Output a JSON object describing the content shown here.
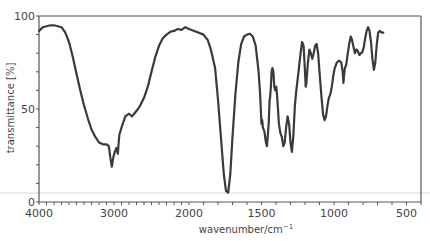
{
  "chart_data": {
    "type": "line",
    "title": "",
    "xlabel": "wavenumber/cm",
    "xlabel_superscript": "−1",
    "ylabel": "transmittance [%]",
    "xlim": [
      4000,
      400
    ],
    "ylim": [
      0,
      100
    ],
    "x_reversed": true,
    "x_scale_break": 2000,
    "grid": false,
    "legend": null,
    "x_ticks": [
      4000,
      3000,
      2000,
      1500,
      1000,
      500
    ],
    "y_ticks": [
      0,
      50,
      100
    ],
    "line_color": "#3a3a3a",
    "series": [
      {
        "name": "IR spectrum",
        "points": [
          [
            4000,
            92
          ],
          [
            3950,
            94
          ],
          [
            3900,
            94.5
          ],
          [
            3850,
            95
          ],
          [
            3800,
            95
          ],
          [
            3750,
            94.5
          ],
          [
            3700,
            94
          ],
          [
            3650,
            91
          ],
          [
            3600,
            86
          ],
          [
            3550,
            78
          ],
          [
            3500,
            69
          ],
          [
            3450,
            60
          ],
          [
            3400,
            52
          ],
          [
            3350,
            45
          ],
          [
            3300,
            39
          ],
          [
            3250,
            35
          ],
          [
            3200,
            32
          ],
          [
            3150,
            31
          ],
          [
            3100,
            31
          ],
          [
            3070,
            30
          ],
          [
            3050,
            24
          ],
          [
            3030,
            19
          ],
          [
            3010,
            24
          ],
          [
            2990,
            27
          ],
          [
            2970,
            29
          ],
          [
            2950,
            26
          ],
          [
            2930,
            36
          ],
          [
            2900,
            40
          ],
          [
            2850,
            46
          ],
          [
            2800,
            47.5
          ],
          [
            2760,
            46
          ],
          [
            2720,
            48
          ],
          [
            2680,
            50
          ],
          [
            2650,
            52
          ],
          [
            2600,
            56
          ],
          [
            2550,
            62
          ],
          [
            2500,
            70
          ],
          [
            2450,
            78
          ],
          [
            2400,
            84
          ],
          [
            2350,
            88
          ],
          [
            2300,
            90
          ],
          [
            2250,
            91.5
          ],
          [
            2200,
            92
          ],
          [
            2150,
            93
          ],
          [
            2100,
            92.5
          ],
          [
            2050,
            94
          ],
          [
            2000,
            93
          ],
          [
            1950,
            91.5
          ],
          [
            1900,
            90
          ],
          [
            1870,
            87
          ],
          [
            1850,
            82
          ],
          [
            1820,
            72
          ],
          [
            1800,
            55
          ],
          [
            1780,
            35
          ],
          [
            1760,
            15
          ],
          [
            1745,
            6
          ],
          [
            1730,
            5
          ],
          [
            1715,
            15
          ],
          [
            1700,
            35
          ],
          [
            1680,
            58
          ],
          [
            1660,
            75
          ],
          [
            1640,
            85
          ],
          [
            1620,
            89
          ],
          [
            1600,
            90
          ],
          [
            1580,
            90.5
          ],
          [
            1560,
            89
          ],
          [
            1540,
            84
          ],
          [
            1520,
            70
          ],
          [
            1510,
            58
          ],
          [
            1500,
            42
          ],
          [
            1495,
            44
          ],
          [
            1490,
            40
          ],
          [
            1480,
            38
          ],
          [
            1470,
            32
          ],
          [
            1462,
            30
          ],
          [
            1455,
            37
          ],
          [
            1450,
            43
          ],
          [
            1445,
            54
          ],
          [
            1440,
            57
          ],
          [
            1435,
            62
          ],
          [
            1430,
            70
          ],
          [
            1425,
            72
          ],
          [
            1418,
            70
          ],
          [
            1412,
            62
          ],
          [
            1405,
            60
          ],
          [
            1398,
            62
          ],
          [
            1390,
            55
          ],
          [
            1380,
            42
          ],
          [
            1370,
            37
          ],
          [
            1360,
            35
          ],
          [
            1350,
            30
          ],
          [
            1340,
            32
          ],
          [
            1330,
            40
          ],
          [
            1320,
            46
          ],
          [
            1310,
            42
          ],
          [
            1300,
            32
          ],
          [
            1290,
            27
          ],
          [
            1280,
            36
          ],
          [
            1270,
            52
          ],
          [
            1260,
            60
          ],
          [
            1245,
            70
          ],
          [
            1230,
            80
          ],
          [
            1220,
            86
          ],
          [
            1210,
            84
          ],
          [
            1200,
            70
          ],
          [
            1195,
            62
          ],
          [
            1190,
            64
          ],
          [
            1180,
            75
          ],
          [
            1170,
            82
          ],
          [
            1160,
            80
          ],
          [
            1150,
            77
          ],
          [
            1140,
            80
          ],
          [
            1130,
            84
          ],
          [
            1120,
            85
          ],
          [
            1110,
            80
          ],
          [
            1100,
            70
          ],
          [
            1085,
            55
          ],
          [
            1075,
            47
          ],
          [
            1065,
            44
          ],
          [
            1055,
            46
          ],
          [
            1045,
            52
          ],
          [
            1035,
            56
          ],
          [
            1025,
            58
          ],
          [
            1015,
            62
          ],
          [
            1005,
            68
          ],
          [
            995,
            72
          ],
          [
            980,
            75
          ],
          [
            965,
            76
          ],
          [
            950,
            75
          ],
          [
            940,
            70
          ],
          [
            935,
            64
          ],
          [
            930,
            68
          ],
          [
            925,
            72
          ],
          [
            915,
            74
          ],
          [
            905,
            80
          ],
          [
            895,
            85
          ],
          [
            885,
            89
          ],
          [
            875,
            87
          ],
          [
            865,
            83
          ],
          [
            855,
            80
          ],
          [
            845,
            82
          ],
          [
            835,
            81
          ],
          [
            825,
            79
          ],
          [
            815,
            80
          ],
          [
            805,
            80.5
          ],
          [
            795,
            83
          ],
          [
            785,
            88
          ],
          [
            775,
            92
          ],
          [
            765,
            94
          ],
          [
            755,
            92
          ],
          [
            745,
            86
          ],
          [
            735,
            77
          ],
          [
            725,
            71
          ],
          [
            715,
            75
          ],
          [
            705,
            85
          ],
          [
            695,
            91
          ],
          [
            685,
            92
          ],
          [
            670,
            91
          ],
          [
            660,
            91
          ]
        ]
      }
    ]
  }
}
